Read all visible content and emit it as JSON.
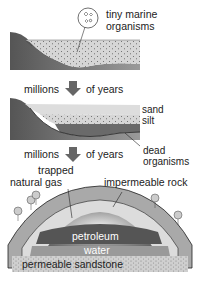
{
  "stage1": {
    "label_line1": "tiny marine",
    "label_line2": "organisms"
  },
  "transition1": {
    "left": "millions",
    "right": "of years"
  },
  "stage2": {
    "sand": "sand",
    "silt": "silt",
    "dead_line1": "dead",
    "dead_line2": "organisms"
  },
  "transition2": {
    "left": "millions",
    "right": "of years"
  },
  "stage3": {
    "gas_line1": "trapped",
    "gas_line2": "natural gas",
    "rock": "impermeable rock",
    "petroleum": "petroleum",
    "water": "water",
    "sandstone": "permeable sandstone"
  },
  "colors": {
    "sediment": "#d6d6d6",
    "land": "#7a7a7a",
    "silt": "#bfbfbf",
    "organic": "#666666",
    "dome_outer": "#a9a9a9",
    "dome_inner": "#dcdcdc",
    "petroleum": "#555555",
    "water": "#9a9a9a",
    "sandstone": "#cfcfcf"
  }
}
